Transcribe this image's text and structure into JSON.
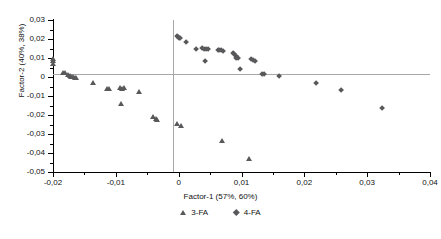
{
  "chart_data": {
    "type": "scatter",
    "title": "",
    "xlabel": "Factor-1 (57%, 60%)",
    "ylabel": "Factor-2 (40%, 38%)",
    "xlim": [
      -0.02,
      0.04
    ],
    "ylim": [
      -0.05,
      0.03
    ],
    "xtick_step": 0.01,
    "ytick_step": 0.01,
    "xticks": [
      "-0,02",
      "-0,01",
      "0",
      "0,01",
      "0,02",
      "0,03",
      "0,04"
    ],
    "xtick_values": [
      -0.02,
      -0.01,
      0,
      0.01,
      0.02,
      0.03,
      0.04
    ],
    "yticks": [
      "0,03",
      "0,02",
      "0,01",
      "0",
      "-0,01",
      "-0,02",
      "-0,03",
      "-0,04",
      "-0,05"
    ],
    "ytick_values": [
      0.03,
      0.02,
      0.01,
      0,
      -0.01,
      -0.02,
      -0.03,
      -0.04,
      -0.05
    ],
    "decimal_separator": ",",
    "grid": false,
    "zero_lines": true,
    "legend_position": "bottom",
    "marker_color": "#59595b",
    "series": [
      {
        "name": "3-FA",
        "marker": "triangle",
        "color": "#59595b",
        "points": [
          [
            -0.02,
            0.0096
          ],
          [
            -0.02,
            0.0083
          ],
          [
            -0.02,
            0.007
          ],
          [
            -0.0183,
            0.0024
          ],
          [
            -0.018,
            0.0021
          ],
          [
            -0.0176,
            0.0012
          ],
          [
            -0.0173,
            0.0005
          ],
          [
            -0.0171,
            0.0002
          ],
          [
            -0.0168,
            -0.0001
          ],
          [
            -0.0165,
            -0.0003
          ],
          [
            -0.0162,
            -0.0004
          ],
          [
            -0.0136,
            -0.003
          ],
          [
            -0.0113,
            -0.0061
          ],
          [
            -0.011,
            -0.0063
          ],
          [
            -0.0093,
            -0.0057
          ],
          [
            -0.009,
            -0.006
          ],
          [
            -0.0087,
            -0.0055
          ],
          [
            -0.0091,
            -0.0141
          ],
          [
            -0.0062,
            -0.0077
          ],
          [
            -0.004,
            -0.0212
          ],
          [
            -0.0036,
            -0.0219
          ],
          [
            -0.0034,
            -0.0224
          ],
          [
            -0.0002,
            -0.0245
          ],
          [
            0.0004,
            -0.0259
          ],
          [
            0.007,
            -0.0337
          ],
          [
            0.0113,
            -0.0433
          ]
        ]
      },
      {
        "name": "4-FA",
        "marker": "diamond",
        "color": "#59595b",
        "points": [
          [
            -0.0003,
            0.0217
          ],
          [
            -0.0001,
            0.0212
          ],
          [
            0.0001,
            0.0207
          ],
          [
            0.0003,
            0.0203
          ],
          [
            0.0012,
            0.0182
          ],
          [
            0.0027,
            0.0145
          ],
          [
            0.0037,
            0.0152
          ],
          [
            0.004,
            0.0148
          ],
          [
            0.0043,
            0.0145
          ],
          [
            0.0047,
            0.0146
          ],
          [
            0.0042,
            0.0084
          ],
          [
            0.0062,
            0.0141
          ],
          [
            0.0065,
            0.0139
          ],
          [
            0.0068,
            0.014
          ],
          [
            0.0071,
            0.0138
          ],
          [
            0.0086,
            0.0126
          ],
          [
            0.0088,
            0.0119
          ],
          [
            0.0091,
            0.011
          ],
          [
            0.0092,
            0.01
          ],
          [
            0.0094,
            0.0098
          ],
          [
            0.0098,
            0.004
          ],
          [
            0.0116,
            0.0092
          ],
          [
            0.0119,
            0.0088
          ],
          [
            0.0121,
            0.0084
          ],
          [
            0.0133,
            0.0017
          ],
          [
            0.0136,
            0.0013
          ],
          [
            0.016,
            0.0003
          ],
          [
            0.0219,
            -0.0034
          ],
          [
            0.0258,
            -0.0071
          ],
          [
            0.0324,
            -0.0166
          ]
        ]
      }
    ],
    "legend": [
      {
        "label": "3-FA",
        "marker": "triangle"
      },
      {
        "label": "4-FA",
        "marker": "diamond"
      }
    ]
  }
}
